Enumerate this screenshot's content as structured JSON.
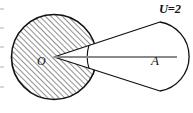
{
  "figure": {
    "title": "",
    "background_color": "#ffffff",
    "stroke_color": "#111111",
    "hatch_color": "#4a4a4a",
    "hatch_background": "#ffffff",
    "axis_line_color": "#8a8a8a",
    "labels": {
      "center_point": "O",
      "interior_point": "A",
      "region_value": "U=2"
    },
    "geometry": {
      "circle_center_x": 54,
      "circle_center_y": 57,
      "circle_radius": 43,
      "cone_apex_x": 54,
      "cone_apex_y": 57,
      "cone_upper_end_x": 160,
      "cone_upper_end_y": 22,
      "cone_lower_end_x": 160,
      "cone_lower_end_y": 91,
      "cap_center_x": 158,
      "cap_center_y": 56,
      "cap_radius": 35,
      "segment_start_x": 54,
      "segment_start_y": 57,
      "segment_end_x": 177,
      "segment_end_y": 57,
      "point_a_x": 155,
      "point_a_y": 57
    }
  }
}
